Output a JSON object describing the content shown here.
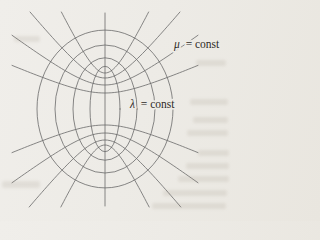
{
  "page": {
    "background_color": "#edebe6",
    "labels": {
      "mu_const": {
        "symbol": "μ",
        "equals_text": "= const"
      },
      "lambda_const": {
        "symbol": "λ",
        "equals_text": "= const"
      }
    },
    "diagram": {
      "line_color": "#6a6a6a",
      "text_color": "#2f2b27",
      "center": {
        "x": 105,
        "y": 109
      },
      "focal_half_distance": 40,
      "vertical_axis": {
        "x": 105,
        "y_top": 13,
        "y_bottom": 206
      },
      "ellipses": [
        {
          "rx": 15,
          "ry": 42.7
        },
        {
          "rx": 32,
          "ry": 51.2
        },
        {
          "rx": 50,
          "ry": 64.0
        },
        {
          "rx": 68,
          "ry": 78.9
        }
      ],
      "hyperbolas": [
        {
          "a": 36
        },
        {
          "a": 31
        },
        {
          "a": 24
        },
        {
          "a": 16
        }
      ],
      "clip": {
        "xmin": 12,
        "xmax": 198,
        "ymin": 12,
        "ymax": 207
      },
      "label_anchors": {
        "mu": {
          "x": 174,
          "y": 48
        },
        "lambda": {
          "x": 130,
          "y": 108
        }
      }
    }
  }
}
